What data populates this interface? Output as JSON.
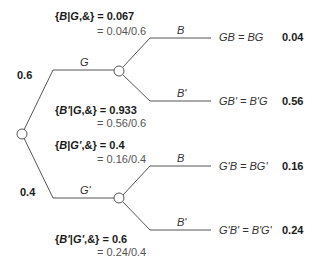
{
  "tree": {
    "root_branches": [
      {
        "label": "G",
        "probability": "0.6"
      },
      {
        "label": "G'",
        "probability": "0.4"
      }
    ],
    "conditionals": [
      {
        "expr_prefix": "{",
        "event": "B",
        "given": "G",
        "suffix": ",&} = ",
        "value": "0.067",
        "ratio": "= 0.04/0.6"
      },
      {
        "expr_prefix": "{",
        "event": "B'",
        "given": "G",
        "suffix": ",&} = ",
        "value": "0.933",
        "ratio": "= 0.56/0.6"
      },
      {
        "expr_prefix": "{",
        "event": "B",
        "given": "G'",
        "suffix": ",&} = ",
        "value": "0.4",
        "ratio": "= 0.16/0.4"
      },
      {
        "expr_prefix": "{",
        "event": "B'",
        "given": "G'",
        "suffix": ",&} = ",
        "value": "0.6",
        "ratio": "= 0.24/0.4"
      }
    ],
    "second_branches": [
      {
        "label": "B"
      },
      {
        "label": "B'"
      },
      {
        "label": "B"
      },
      {
        "label": "B'"
      }
    ],
    "outcomes": [
      {
        "expr": "GB = BG",
        "probability": "0.04"
      },
      {
        "expr": "GB' = B'G",
        "probability": "0.56"
      },
      {
        "expr": "G'B = BG'",
        "probability": "0.16"
      },
      {
        "expr": "G'B' = B'G'",
        "probability": "0.24"
      }
    ]
  },
  "colors": {
    "line": "#555555",
    "node_fill": "#ffffff"
  }
}
